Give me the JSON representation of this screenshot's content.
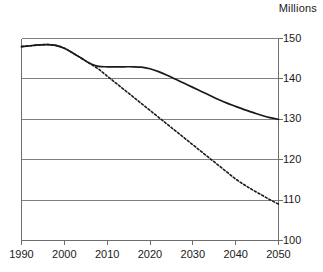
{
  "chart_data": {
    "type": "line",
    "title": "Millions",
    "xlabel": "",
    "ylabel": "",
    "xlim": [
      1990,
      2050
    ],
    "ylim": [
      100,
      150
    ],
    "xticks": [
      1990,
      2000,
      2010,
      2020,
      2030,
      2040,
      2050
    ],
    "yticks": [
      100,
      110,
      120,
      130,
      140,
      150
    ],
    "grid": "horizontal",
    "legend": "none",
    "axis_position": "right",
    "colors": {
      "line": "#1a1a1a",
      "grid": "#808080",
      "axis": "#6e6e6e",
      "background": "#ffffff"
    },
    "x": [
      1990,
      1992,
      1994,
      1996,
      1998,
      2000,
      2002,
      2004,
      2006,
      2008,
      2010,
      2012,
      2014,
      2016,
      2018,
      2020,
      2022,
      2024,
      2026,
      2028,
      2030,
      2032,
      2034,
      2036,
      2038,
      2040,
      2042,
      2044,
      2046,
      2048,
      2050
    ],
    "series": [
      {
        "name": "solid-projection",
        "style": "solid",
        "values": [
          148.0,
          148.2,
          148.4,
          148.5,
          148.3,
          147.6,
          146.4,
          145.1,
          143.8,
          143.1,
          143.0,
          143.0,
          143.0,
          143.0,
          142.9,
          142.5,
          141.8,
          140.9,
          139.9,
          138.9,
          137.9,
          136.9,
          135.9,
          134.9,
          134.0,
          133.2,
          132.4,
          131.7,
          131.0,
          130.4,
          130.0
        ]
      },
      {
        "name": "dashed-projection",
        "style": "dashed",
        "values": [
          148.0,
          148.2,
          148.4,
          148.5,
          148.3,
          147.6,
          146.4,
          145.1,
          143.8,
          142.4,
          140.7,
          139.0,
          137.3,
          135.6,
          133.9,
          132.2,
          130.5,
          128.8,
          127.1,
          125.4,
          123.7,
          122.0,
          120.3,
          118.6,
          116.9,
          115.2,
          113.8,
          112.5,
          111.3,
          110.1,
          109.0
        ]
      }
    ]
  },
  "yticklabels": [
    "150",
    "140",
    "130",
    "120",
    "110",
    "100"
  ],
  "xticklabels": [
    "1990",
    "2000",
    "2010",
    "2020",
    "2030",
    "2040",
    "2050"
  ]
}
